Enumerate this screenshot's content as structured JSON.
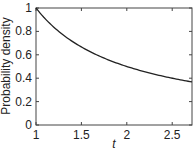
{
  "chart_data": {
    "type": "line",
    "title": "",
    "xlabel": "t",
    "ylabel": "Probability density",
    "xlim": [
      1,
      2.718
    ],
    "ylim": [
      0,
      1
    ],
    "x_ticks": [
      1,
      1.5,
      2,
      2.5
    ],
    "x_tick_labels": [
      "1",
      "1.5",
      "2",
      "2.5"
    ],
    "y_ticks": [
      0,
      0.2,
      0.4,
      0.6,
      0.8,
      1
    ],
    "y_tick_labels": [
      "0",
      "0.2",
      "0.4",
      "0.6",
      "0.8",
      "1"
    ],
    "grid": false,
    "legend": null,
    "series": [
      {
        "name": "density",
        "function": "1/t",
        "color": "#222222",
        "x": [
          1.0,
          1.1,
          1.2,
          1.3,
          1.4,
          1.5,
          1.6,
          1.7,
          1.8,
          1.9,
          2.0,
          2.1,
          2.2,
          2.3,
          2.4,
          2.5,
          2.6,
          2.718
        ],
        "y": [
          1.0,
          0.909,
          0.833,
          0.769,
          0.714,
          0.667,
          0.625,
          0.588,
          0.556,
          0.526,
          0.5,
          0.476,
          0.455,
          0.435,
          0.417,
          0.4,
          0.385,
          0.368
        ]
      }
    ]
  }
}
